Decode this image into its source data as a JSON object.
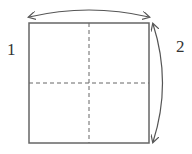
{
  "diagram": {
    "labels": [
      {
        "id": "1",
        "text": "1"
      },
      {
        "id": "2",
        "text": "2"
      }
    ],
    "shape": "square divided into four quadrants by dashed lines",
    "arrows": [
      {
        "name": "top-double-arrow",
        "direction": "horizontal"
      },
      {
        "name": "right-double-arrow",
        "direction": "vertical"
      }
    ],
    "colors": {
      "stroke": "#555555",
      "background": "#ffffff"
    }
  }
}
